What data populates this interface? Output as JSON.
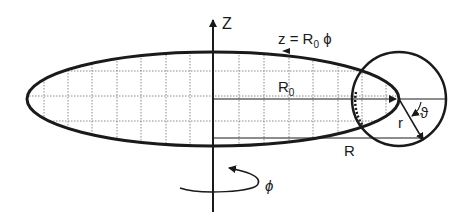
{
  "diagram": {
    "labels": {
      "z_axis": "Z",
      "helix_eq_main": "z = R",
      "helix_eq_sub": "0",
      "helix_eq_tail": " ϕ",
      "r0_main": "R",
      "r0_sub": "0",
      "R": "R",
      "r": "r",
      "theta": "ϑ",
      "phi": "ϕ"
    },
    "colors": {
      "ink": "#1a1a1a",
      "grid": "#8a8a8a",
      "background": "#ffffff"
    }
  }
}
